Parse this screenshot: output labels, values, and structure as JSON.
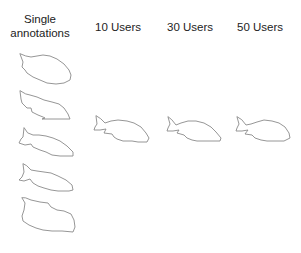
{
  "figure": {
    "columns": [
      {
        "id": "single",
        "label": "Single annotations",
        "label_lines": [
          "Single",
          "annotations"
        ]
      },
      {
        "id": "10",
        "label": "10 Users"
      },
      {
        "id": "30",
        "label": "30 Users"
      },
      {
        "id": "50",
        "label": "50 Users"
      }
    ],
    "single_annotations": {
      "count": 5,
      "items": [
        {
          "label": "annotation-1"
        },
        {
          "label": "annotation-2"
        },
        {
          "label": "annotation-3"
        },
        {
          "label": "annotation-4"
        },
        {
          "label": "annotation-5"
        }
      ]
    },
    "aggregated": [
      {
        "users": "10 Users"
      },
      {
        "users": "30 Users"
      },
      {
        "users": "50 Users"
      }
    ],
    "stroke_color": "#8a8a8a",
    "background": "#ffffff"
  }
}
